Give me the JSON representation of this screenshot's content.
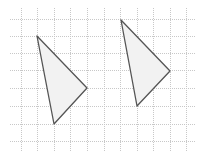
{
  "diagram": {
    "type": "grid-triangles",
    "background": "#ffffff",
    "grid": {
      "color": "#c8c8c8",
      "dash": "1,1",
      "x_lines": [
        21,
        37,
        54,
        70,
        87,
        104,
        120,
        137,
        153,
        170,
        186
      ],
      "y_lines": [
        19,
        36,
        53,
        70,
        88,
        106,
        124,
        141
      ],
      "x_extent": [
        10,
        196
      ],
      "y_extent": [
        8,
        152
      ]
    },
    "shapes": [
      {
        "name": "triangle-left",
        "points": [
          [
            37,
            36
          ],
          [
            87,
            88
          ],
          [
            54,
            124
          ]
        ],
        "fill": "#f2f2f2",
        "stroke": "#555555"
      },
      {
        "name": "triangle-right",
        "points": [
          [
            121,
            20
          ],
          [
            170,
            71
          ],
          [
            137,
            106
          ]
        ],
        "fill": "#f2f2f2",
        "stroke": "#555555"
      }
    ]
  }
}
